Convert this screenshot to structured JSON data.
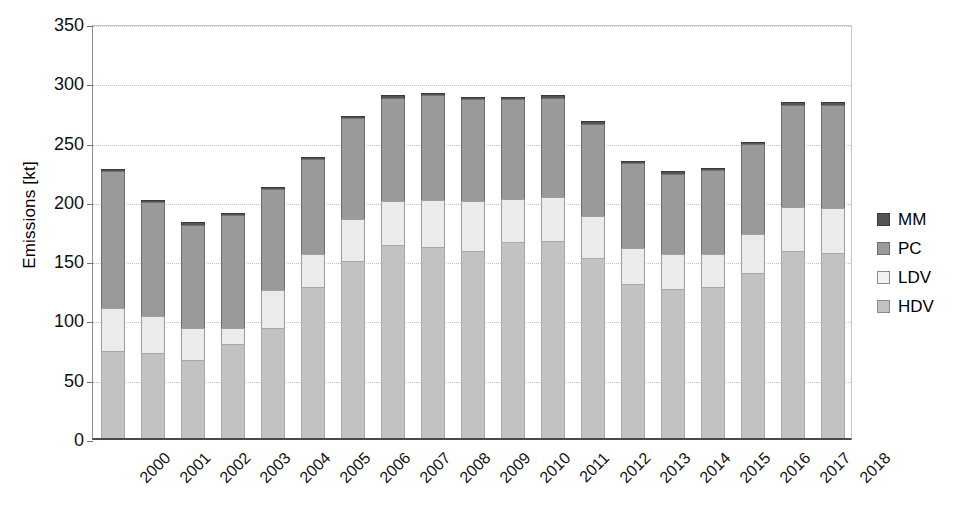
{
  "chart_data": {
    "type": "bar",
    "stacked": true,
    "title": "",
    "xlabel": "",
    "ylabel": "Emissions [kt]",
    "ylim": [
      0,
      350
    ],
    "ytick_step": 50,
    "yticks": [
      "0",
      "50",
      "100",
      "150",
      "200",
      "250",
      "300",
      "350"
    ],
    "grid": true,
    "legend_position": "right",
    "categories": [
      "2000",
      "2001",
      "2002",
      "2003",
      "2004",
      "2005",
      "2006",
      "2007",
      "2008",
      "2009",
      "2010",
      "2011",
      "2012",
      "2013",
      "2014",
      "2015",
      "2016",
      "2017",
      "2018"
    ],
    "series": [
      {
        "name": "HDV",
        "color": "#c2c2c2",
        "values": [
          73,
          72,
          66,
          79,
          93,
          127,
          149,
          163,
          161,
          158,
          165,
          166,
          152,
          130,
          126,
          127,
          139,
          158,
          156
        ]
      },
      {
        "name": "LDV",
        "color": "#ebebeb",
        "values": [
          37,
          31,
          27,
          14,
          32,
          28,
          36,
          37,
          40,
          42,
          37,
          37,
          35,
          30,
          29,
          28,
          33,
          37,
          38
        ]
      },
      {
        "name": "PC",
        "color": "#9a9a9a",
        "values": [
          115,
          96,
          87,
          95,
          85,
          80,
          85,
          87,
          88,
          86,
          84,
          84,
          78,
          72,
          68,
          71,
          76,
          86,
          87
        ]
      },
      {
        "name": "MM",
        "color": "#555555",
        "values": [
          2,
          2,
          2,
          2,
          2,
          2,
          2,
          2,
          2,
          2,
          2,
          2,
          2,
          2,
          2,
          2,
          2,
          2,
          2
        ]
      }
    ],
    "totals": [
      227,
      201,
      182,
      190,
      212,
      237,
      272,
      289,
      291,
      288,
      288,
      289,
      267,
      234,
      225,
      228,
      250,
      283,
      283
    ]
  },
  "legend": {
    "entries": [
      {
        "label": "MM",
        "key": "mm"
      },
      {
        "label": "PC",
        "key": "pc"
      },
      {
        "label": "LDV",
        "key": "ldv"
      },
      {
        "label": "HDV",
        "key": "hdv"
      }
    ]
  }
}
